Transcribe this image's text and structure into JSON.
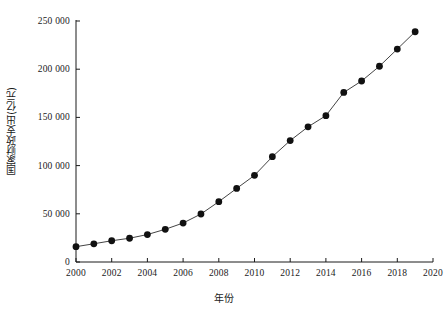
{
  "chart_data": {
    "type": "line",
    "title": "",
    "subtitle": "",
    "xlabel": "年份",
    "ylabel": "国家财政支出(亿元)",
    "xlim": [
      2000,
      2020
    ],
    "ylim": [
      0,
      250000
    ],
    "grid": false,
    "legend": null,
    "marker": "filled-circle",
    "marker_color": "#111111",
    "line_color": "#444444",
    "x": [
      2000,
      2001,
      2002,
      2003,
      2004,
      2005,
      2006,
      2007,
      2008,
      2009,
      2010,
      2011,
      2012,
      2013,
      2014,
      2015,
      2016,
      2017,
      2018,
      2019
    ],
    "values": [
      15887,
      18903,
      22053,
      24650,
      28487,
      33930,
      40423,
      49781,
      62593,
      76300,
      89874,
      109248,
      125953,
      140212,
      151786,
      175878,
      187755,
      203085,
      220906,
      238874
    ],
    "xticks": [
      2000,
      2002,
      2004,
      2006,
      2008,
      2010,
      2012,
      2014,
      2016,
      2018,
      2020
    ],
    "xtick_labels": [
      "2000",
      "2002",
      "2004",
      "2006",
      "2008",
      "2010",
      "2012",
      "2014",
      "2016",
      "2018",
      "2020"
    ],
    "yticks": [
      0,
      50000,
      100000,
      150000,
      200000,
      250000
    ],
    "ytick_labels": [
      "0",
      "50 000",
      "100 000",
      "150 000",
      "200 000",
      "250 000"
    ]
  },
  "axes": {
    "x_axis_name": "year-axis",
    "y_axis_name": "expenditure-axis"
  }
}
